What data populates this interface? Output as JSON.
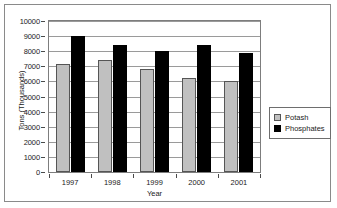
{
  "chart_data": {
    "type": "bar",
    "title": "",
    "xlabel": "Year",
    "ylabel": "Tons (Thousands)",
    "categories": [
      "1997",
      "1998",
      "1999",
      "2000",
      "2001"
    ],
    "series": [
      {
        "name": "Potash",
        "color": "#c0c0c0",
        "values": [
          7150,
          7400,
          6850,
          6200,
          6050
        ]
      },
      {
        "name": "Phosphates",
        "color": "#000000",
        "values": [
          9000,
          8400,
          8000,
          8400,
          7900
        ]
      }
    ],
    "ylim": [
      0,
      10000
    ],
    "ytick_labels": [
      "10000",
      "9000",
      "8000",
      "7000",
      "6000",
      "5000",
      "4000",
      "3000",
      "2000",
      "1000",
      "0"
    ],
    "ytick_values": [
      10000,
      9000,
      8000,
      7000,
      6000,
      5000,
      4000,
      3000,
      2000,
      1000,
      0
    ],
    "grid": true,
    "legend_position": "right"
  },
  "legend": {
    "entries": [
      {
        "label": "Potash"
      },
      {
        "label": "Phosphates"
      }
    ]
  }
}
